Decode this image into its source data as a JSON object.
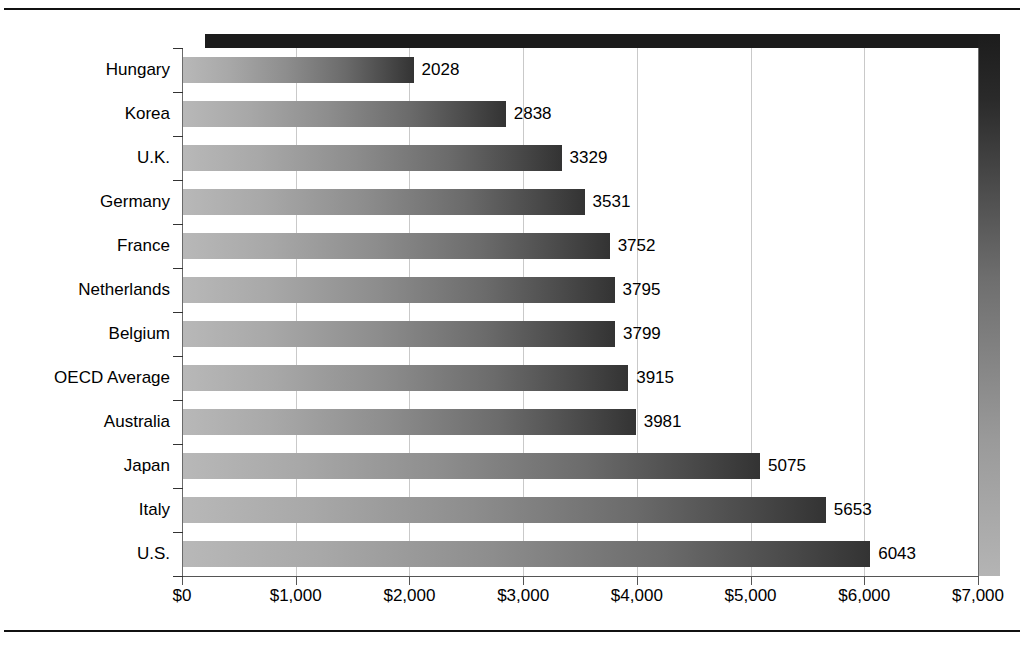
{
  "chart_data": {
    "type": "bar",
    "orientation": "horizontal",
    "title": "",
    "subtitle": "",
    "xlabel": "",
    "ylabel": "",
    "categories": [
      "Hungary",
      "Korea",
      "U.K.",
      "Germany",
      "France",
      "Netherlands",
      "Belgium",
      "OECD Average",
      "Australia",
      "Japan",
      "Italy",
      "U.S."
    ],
    "values": [
      2028,
      2838,
      3329,
      3531,
      3752,
      3795,
      3799,
      3915,
      3981,
      5075,
      5653,
      6043
    ],
    "data_labels": [
      "2028",
      "2838",
      "3329",
      "3531",
      "3752",
      "3795",
      "3799",
      "3915",
      "3981",
      "5075",
      "5653",
      "6043"
    ],
    "xlim": [
      0,
      7000
    ],
    "xticks": [
      0,
      1000,
      2000,
      3000,
      4000,
      5000,
      6000,
      7000
    ],
    "xtick_labels": [
      "$0",
      "$1,000",
      "$2,000",
      "$3,000",
      "$4,000",
      "$5,000",
      "$6,000",
      "$7,000"
    ],
    "grid": "vertical",
    "legend": "none",
    "series": [
      {
        "name": "Spending per student",
        "values": [
          2028,
          2838,
          3329,
          3531,
          3752,
          3795,
          3799,
          3915,
          3981,
          5075,
          5653,
          6043
        ]
      }
    ]
  },
  "style": {
    "bar_gradient_start": "#b8b8b8",
    "bar_gradient_end": "#333333",
    "gridline_color": "#c9c9c9",
    "axis_color": "#555555",
    "shadow_color": "#1c1c1c",
    "text_color": "#000000",
    "background": "#ffffff"
  }
}
